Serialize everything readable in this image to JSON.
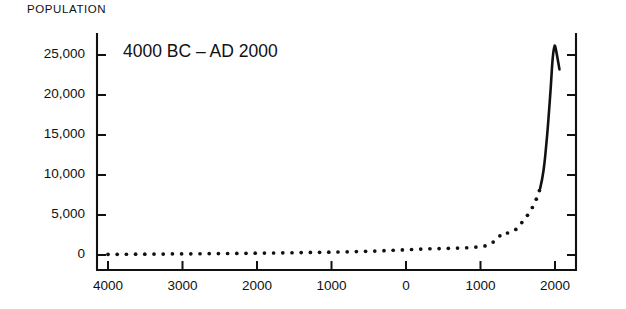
{
  "figure": {
    "axis_label": "POPULATION",
    "title": "4000 BC – AD 2000",
    "ink_color": "#111111",
    "background_color": "#ffffff"
  },
  "chart_data": {
    "type": "line",
    "title": "4000 BC – AD 2000",
    "subtitle": "",
    "xlabel": "",
    "ylabel": "POPULATION",
    "grid": false,
    "legend": null,
    "ylim": [
      0,
      27500
    ],
    "xlim": [
      -4000,
      2100
    ],
    "y_ticks": [
      0,
      5000,
      10000,
      15000,
      20000,
      25000
    ],
    "y_tick_labels": [
      "0",
      "5,000",
      "10,000",
      "15,000",
      "20,000",
      "25,000"
    ],
    "x_ticks": [
      -4000,
      -3000,
      -2000,
      -1000,
      0,
      1000,
      2000
    ],
    "x_tick_labels": [
      "4000",
      "3000",
      "2000",
      "1000",
      "0",
      "1000",
      "2000"
    ],
    "note": "x tick labels show years before/after year 0 without BC/AD signs; values are population in millions",
    "series": [
      {
        "name": "world-population-dotted",
        "style": "dotted",
        "x": [
          -4000,
          -3900,
          -3800,
          -3700,
          -3600,
          -3500,
          -3400,
          -3300,
          -3200,
          -3100,
          -3000,
          -2900,
          -2800,
          -2700,
          -2600,
          -2500,
          -2400,
          -2300,
          -2200,
          -2100,
          -2000,
          -1900,
          -1800,
          -1700,
          -1600,
          -1500,
          -1400,
          -1300,
          -1200,
          -1100,
          -1000,
          -900,
          -800,
          -700,
          -600,
          -500,
          -400,
          -300,
          -200,
          -100,
          0,
          100,
          200,
          300,
          400,
          500,
          600,
          700,
          800,
          900,
          1000,
          1100,
          1200,
          1250,
          1300,
          1350,
          1400,
          1450,
          1500,
          1550,
          1600,
          1650,
          1700,
          1750,
          1800
        ],
        "y": [
          80,
          85,
          90,
          95,
          100,
          105,
          112,
          118,
          125,
          132,
          140,
          148,
          156,
          164,
          172,
          180,
          190,
          200,
          210,
          220,
          230,
          240,
          250,
          262,
          274,
          286,
          300,
          315,
          330,
          345,
          360,
          380,
          400,
          420,
          440,
          470,
          500,
          540,
          580,
          620,
          660,
          700,
          740,
          780,
          800,
          820,
          840,
          870,
          900,
          950,
          1050,
          1200,
          1800,
          2300,
          2800,
          2700,
          2900,
          3000,
          3400,
          4000,
          4600,
          5200,
          6000,
          7000,
          8300
        ]
      },
      {
        "name": "world-population-solid",
        "style": "solid",
        "x": [
          1800,
          1830,
          1860,
          1880,
          1900,
          1920,
          1940,
          1950,
          1960,
          1970,
          1980,
          1990,
          2000,
          2030,
          2060
        ],
        "y": [
          8300,
          9500,
          11500,
          13500,
          15500,
          18000,
          20500,
          22000,
          23500,
          24700,
          25500,
          26000,
          26300,
          24800,
          23200
        ]
      }
    ]
  }
}
